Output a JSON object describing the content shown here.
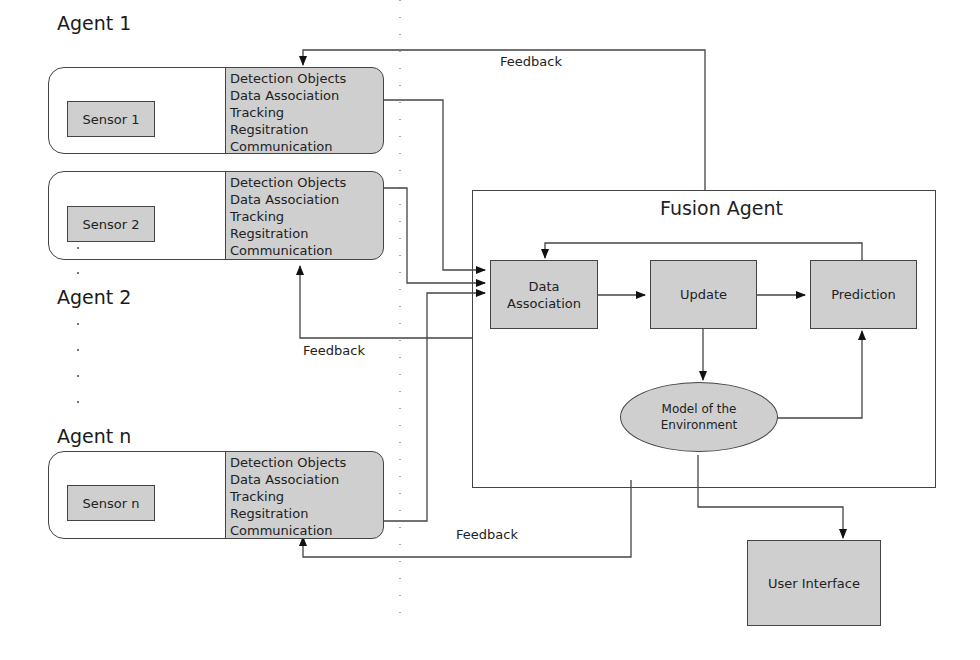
{
  "agents": [
    {
      "title": "Agent 1",
      "sensor": "Sensor  1",
      "functions": [
        "Detection Objects",
        "Data Association",
        "Tracking",
        "Regsitration",
        "Communication"
      ]
    },
    {
      "title": "Agent 2",
      "sensor": "Sensor 2",
      "functions": [
        "Detection Objects",
        "Data Association",
        "Tracking",
        "Regsitration",
        "Communication"
      ]
    },
    {
      "title": "Agent n",
      "sensor": "Sensor n",
      "functions": [
        "Detection Objects",
        "Data Association",
        "Tracking",
        "Regsitration",
        "Communication"
      ]
    }
  ],
  "fusion": {
    "title": "Fusion Agent",
    "data_association": "Data Association",
    "update": "Update",
    "prediction": "Prediction",
    "model": "Model of the Environment"
  },
  "user_interface": "User Interface",
  "feedback_labels": [
    "Feedback",
    "Feedback",
    "Feedback"
  ],
  "colors": {
    "block_fill": "#cfcfcf",
    "stroke": "#444444"
  }
}
